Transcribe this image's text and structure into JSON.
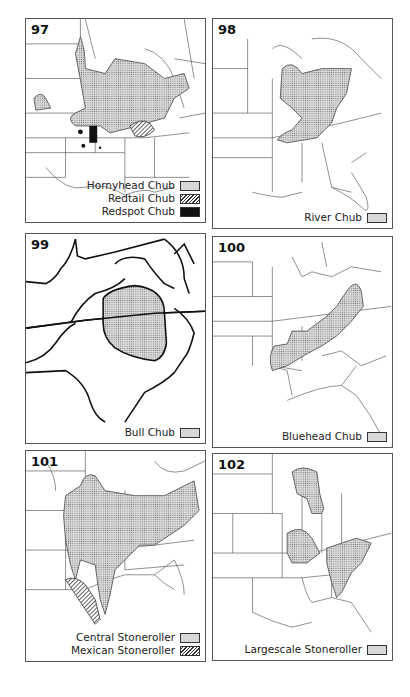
{
  "colors": {
    "stipple_fill": "#d8d8d8",
    "line": "#333333",
    "solid": "#111111"
  },
  "panels": [
    {
      "number": "97",
      "legend": [
        {
          "label": "Hornyhead Chub",
          "pattern": "stipple"
        },
        {
          "label": "Redtail Chub",
          "pattern": "hatch"
        },
        {
          "label": "Redspot Chub",
          "pattern": "solid"
        }
      ]
    },
    {
      "number": "98",
      "legend": [
        {
          "label": "River Chub",
          "pattern": "stipple"
        }
      ]
    },
    {
      "number": "99",
      "legend": [
        {
          "label": "Bull Chub",
          "pattern": "stipple"
        }
      ]
    },
    {
      "number": "100",
      "legend": [
        {
          "label": "Bluehead Chub",
          "pattern": "stipple"
        }
      ]
    },
    {
      "number": "101",
      "legend": [
        {
          "label": "Central Stoneroller",
          "pattern": "stipple"
        },
        {
          "label": "Mexican Stoneroller",
          "pattern": "hatch"
        }
      ]
    },
    {
      "number": "102",
      "legend": [
        {
          "label": "Largescale Stoneroller",
          "pattern": "stipple"
        }
      ]
    }
  ]
}
